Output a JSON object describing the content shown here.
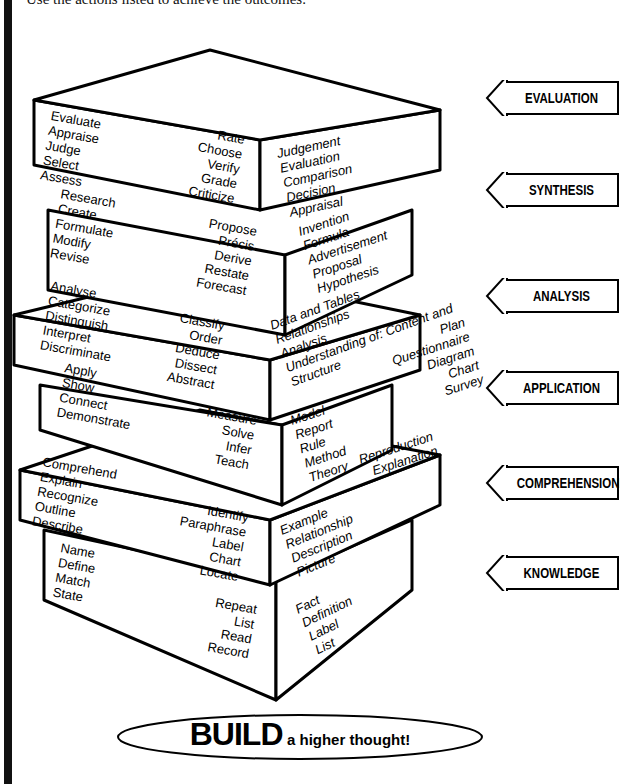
{
  "intro_text": "Use the actions listed to achieve the outcomes.",
  "levels": [
    {
      "name": "EVALUATION",
      "verbs_left": [
        "Evaluate",
        "Appraise",
        "Judge",
        "Select",
        "Assess"
      ],
      "verbs_right": [
        "Rate",
        "Choose",
        "Verify",
        "Grade",
        "Criticize"
      ],
      "outcomes": [
        "Judgement",
        "Evaluation",
        "Comparison",
        "Decision",
        "Appraisal"
      ],
      "outcomes_right": []
    },
    {
      "name": "SYNTHESIS",
      "verbs_left": [
        "Research",
        "Create",
        "Formulate",
        "Modify",
        "Revise"
      ],
      "verbs_right": [
        "Propose",
        "Précis",
        "Derive",
        "Restate",
        "Forecast"
      ],
      "outcomes": [
        "Invention",
        "Formula",
        "Advertisement",
        "Proposal",
        "Hypothesis"
      ],
      "outcomes_right": []
    },
    {
      "name": "ANALYSIS",
      "verbs_left": [
        "Analyse",
        "Categorize",
        "Distinguish",
        "Interpret",
        "Discriminate"
      ],
      "verbs_right": [
        "Classify",
        "Order",
        "Deduce",
        "Dissect",
        "Abstract"
      ],
      "outcomes": [
        "Data and Tables",
        "Relationships",
        "Analysis",
        "Understanding of: Content and",
        "Structure"
      ],
      "outcomes_right": []
    },
    {
      "name": "APPLICATION",
      "verbs_left": [
        "Apply",
        "Show",
        "Connect",
        "Demonstrate"
      ],
      "verbs_right": [
        "Measure",
        "Solve",
        "Infer",
        "Teach"
      ],
      "outcomes": [
        "Model",
        "Report",
        "Rule",
        "Method",
        "Theory"
      ],
      "outcomes_right": [
        "Plan",
        "Questionnaire",
        "Diagram",
        "Chart",
        "Survey"
      ]
    },
    {
      "name": "COMPREHENSION",
      "verbs_left": [
        "Comprehend",
        "Explain",
        "Recognize",
        "Outline",
        "Describe"
      ],
      "verbs_right": [
        "Identify",
        "Paraphrase",
        "Label",
        "Chart",
        "Locate"
      ],
      "outcomes": [
        "Example",
        "Relationship",
        "Description",
        "Picture"
      ],
      "outcomes_right": [
        "Reproduction",
        "Explanation"
      ]
    },
    {
      "name": "KNOWLEDGE",
      "verbs_left": [
        "Name",
        "Define",
        "Match",
        "State"
      ],
      "verbs_right": [
        "Repeat",
        "List",
        "Read",
        "Record"
      ],
      "outcomes": [
        "Fact",
        "Definition",
        "Label",
        "List"
      ],
      "outcomes_right": []
    }
  ],
  "slogan": {
    "big": "BUILD",
    "small": "a higher thought!"
  },
  "colors": {
    "ink": "#000000",
    "background": "#ffffff"
  }
}
